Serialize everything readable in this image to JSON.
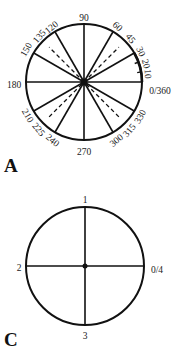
{
  "panels": [
    {
      "id": "A",
      "panel_label": "A",
      "center": [
        84,
        82
      ],
      "radius": 58,
      "solid_diameters_deg": [
        0,
        30,
        60,
        90,
        120,
        150
      ],
      "dashed_diameters_deg": [
        45,
        135
      ],
      "minor_ticks_deg": [
        10,
        20
      ],
      "labels": [
        {
          "text": "90",
          "x": 84,
          "y": 19,
          "rot": 0
        },
        {
          "text": "60",
          "x": 117,
          "y": 27,
          "rot": 45
        },
        {
          "text": "45",
          "x": 130,
          "y": 39,
          "rot": 50
        },
        {
          "text": "30",
          "x": 140,
          "y": 52,
          "rot": 65
        },
        {
          "text": "20",
          "x": 145,
          "y": 64,
          "rot": 75
        },
        {
          "text": "10",
          "x": 147,
          "y": 74,
          "rot": 85
        },
        {
          "text": "0/360",
          "x": 160,
          "y": 92,
          "rot": 0
        },
        {
          "text": "120",
          "x": 52,
          "y": 28,
          "rot": -40
        },
        {
          "text": "135",
          "x": 40,
          "y": 37,
          "rot": -50
        },
        {
          "text": "150",
          "x": 27,
          "y": 50,
          "rot": -60
        },
        {
          "text": "180",
          "x": 14,
          "y": 86,
          "rot": 0
        },
        {
          "text": "210",
          "x": 27,
          "y": 116,
          "rot": 60
        },
        {
          "text": "225",
          "x": 38,
          "y": 130,
          "rot": 50
        },
        {
          "text": "240",
          "x": 52,
          "y": 141,
          "rot": 40
        },
        {
          "text": "270",
          "x": 84,
          "y": 153,
          "rot": 0
        },
        {
          "text": "300",
          "x": 117,
          "y": 141,
          "rot": -40
        },
        {
          "text": "315",
          "x": 130,
          "y": 131,
          "rot": -50
        },
        {
          "text": "330",
          "x": 141,
          "y": 117,
          "rot": -60
        }
      ]
    },
    {
      "id": "C",
      "panel_label": "C",
      "center": [
        85,
        266
      ],
      "radius": 59,
      "solid_diameters_deg": [
        0,
        90
      ],
      "dashed_diameters_deg": [],
      "minor_ticks_deg": [],
      "labels": [
        {
          "text": "1",
          "x": 85,
          "y": 201,
          "rot": 0
        },
        {
          "text": "2",
          "x": 19,
          "y": 269,
          "rot": 0
        },
        {
          "text": "0/4",
          "x": 157,
          "y": 271,
          "rot": 0
        },
        {
          "text": "3",
          "x": 85,
          "y": 337,
          "rot": 0
        }
      ]
    }
  ],
  "panel_labels": {
    "a": "A",
    "c": "C"
  },
  "colors": {
    "stroke": "#111111",
    "background": "#ffffff"
  }
}
